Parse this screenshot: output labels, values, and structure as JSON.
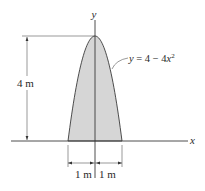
{
  "figure": {
    "axes": {
      "x_label": "x",
      "y_label": "y"
    },
    "curve": {
      "equation_prefix": "y = 4 − 4x",
      "equation_exponent": "2",
      "equation_full": "y = 4 − 4x²",
      "a": 4,
      "b": 4,
      "x_range": [
        -1,
        1
      ],
      "fill_color": "#d6d6d6",
      "stroke_color": "#3a3a3a"
    },
    "dimensions": {
      "height_label": "4 m",
      "left_width_label": "1 m",
      "right_width_label": "1 m"
    }
  }
}
